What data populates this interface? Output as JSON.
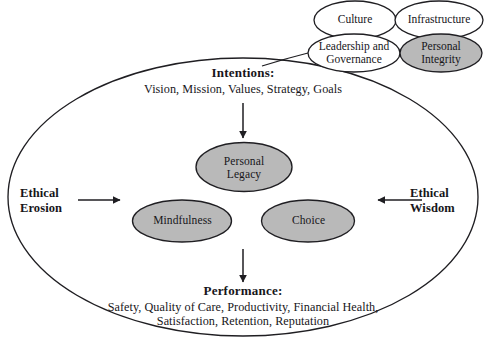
{
  "diagram": {
    "title_text_blocks": {
      "intentions": {
        "heading": "Intentions:",
        "detail": "Vision, Mission, Values, Strategy, Goals"
      },
      "performance": {
        "heading": "Performance:",
        "detail_line1": "Safety, Quality of Care, Productivity, Financial Health,",
        "detail_line2": "Satisfaction, Retention, Reputation"
      }
    },
    "side_labels": {
      "left_line1": "Ethical",
      "left_line2": "Erosion",
      "right_line1": "Ethical",
      "right_line2": "Wisdom"
    },
    "core_nodes": [
      {
        "line1": "Personal",
        "line2": "Legacy"
      },
      {
        "line1": "Mindfulness",
        "line2": ""
      },
      {
        "line1": "Choice",
        "line2": ""
      }
    ],
    "context_nodes": [
      {
        "line1": "Culture",
        "line2": "",
        "shaded": false
      },
      {
        "line1": "Infrastructure",
        "line2": "",
        "shaded": false
      },
      {
        "line1": "Leadership and",
        "line2": "Governance",
        "shaded": false
      },
      {
        "line1": "Personal",
        "line2": "Integrity",
        "shaded": true
      }
    ],
    "colors": {
      "stroke": "#1f1e22",
      "shaded_fill": "#b9b9b9",
      "unshaded_fill": "#ffffff",
      "background": "#ffffff",
      "text": "#17161a"
    }
  }
}
